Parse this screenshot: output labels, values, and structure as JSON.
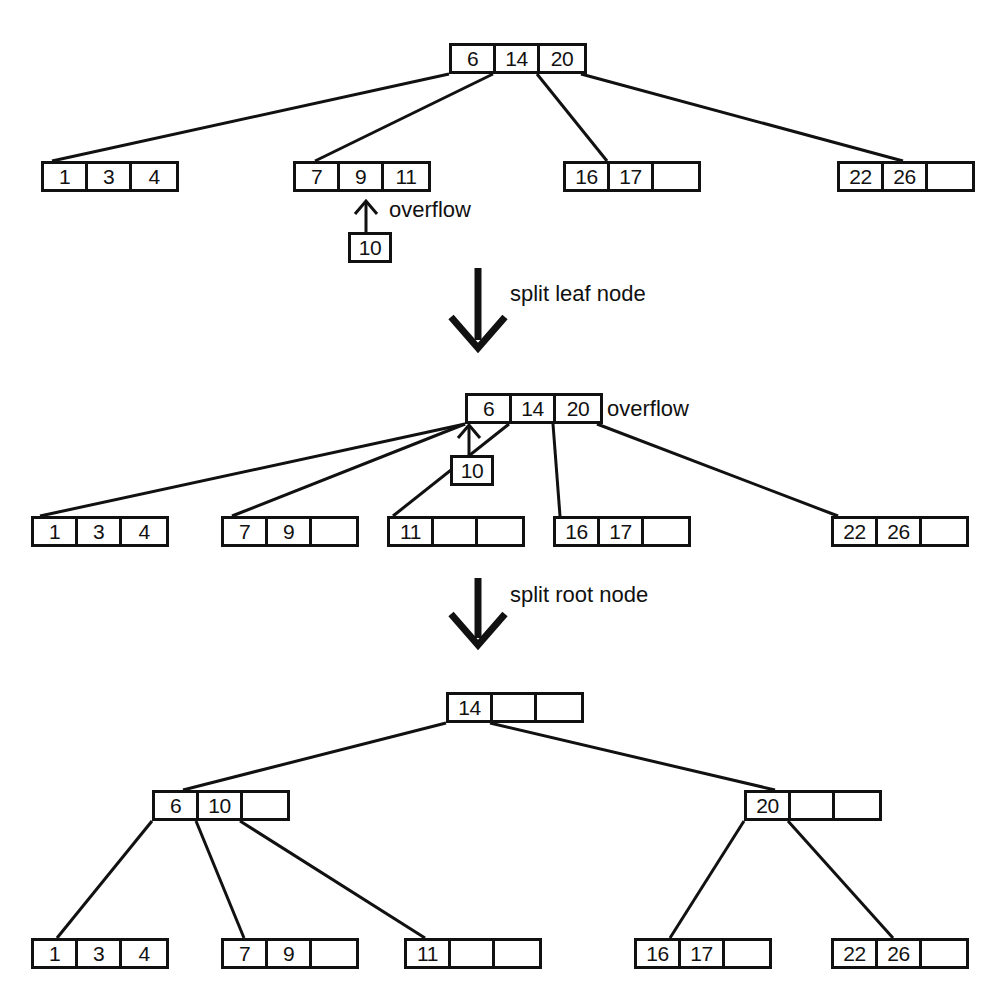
{
  "figure": {
    "type": "diagram"
  },
  "stages": [
    {
      "id": "stage-1-before-split",
      "root": {
        "id": "t1-root",
        "cells": [
          "6",
          "14",
          "20"
        ]
      },
      "leaves": [
        {
          "id": "t1-leaf-1",
          "cells": [
            "1",
            "3",
            "4"
          ]
        },
        {
          "id": "t1-leaf-2",
          "cells": [
            "7",
            "9",
            "11"
          ]
        },
        {
          "id": "t1-leaf-3",
          "cells": [
            "16",
            "17",
            ""
          ]
        },
        {
          "id": "t1-leaf-4",
          "cells": [
            "22",
            "26",
            ""
          ]
        }
      ],
      "overflow": {
        "id": "t1-overflow-box",
        "cells": [
          "10"
        ],
        "label": "overflow"
      }
    },
    {
      "id": "stage-2-after-leaf-split",
      "root": {
        "id": "t2-root",
        "cells": [
          "6",
          "14",
          "20"
        ]
      },
      "root_overflow_label": "overflow",
      "leaves": [
        {
          "id": "t2-leaf-1",
          "cells": [
            "1",
            "3",
            "4"
          ]
        },
        {
          "id": "t2-leaf-2",
          "cells": [
            "7",
            "9",
            ""
          ]
        },
        {
          "id": "t2-leaf-3",
          "cells": [
            "11",
            "",
            ""
          ]
        },
        {
          "id": "t2-leaf-4",
          "cells": [
            "16",
            "17",
            ""
          ]
        },
        {
          "id": "t2-leaf-5",
          "cells": [
            "22",
            "26",
            ""
          ]
        }
      ],
      "overflow": {
        "id": "t2-overflow-box",
        "cells": [
          "10"
        ]
      }
    },
    {
      "id": "stage-3-after-root-split",
      "root": {
        "id": "t3-root",
        "cells": [
          "14",
          "",
          ""
        ]
      },
      "internals": [
        {
          "id": "t3-internal-left",
          "cells": [
            "6",
            "10",
            ""
          ]
        },
        {
          "id": "t3-internal-right",
          "cells": [
            "20",
            "",
            ""
          ]
        }
      ],
      "leaves": [
        {
          "id": "t3-leaf-1",
          "cells": [
            "1",
            "3",
            "4"
          ]
        },
        {
          "id": "t3-leaf-2",
          "cells": [
            "7",
            "9",
            ""
          ]
        },
        {
          "id": "t3-leaf-3",
          "cells": [
            "11",
            "",
            ""
          ]
        },
        {
          "id": "t3-leaf-4",
          "cells": [
            "16",
            "17",
            ""
          ]
        },
        {
          "id": "t3-leaf-5",
          "cells": [
            "22",
            "26",
            ""
          ]
        }
      ]
    }
  ],
  "transitions": [
    {
      "id": "transition-1",
      "label": "split leaf node"
    },
    {
      "id": "transition-2",
      "label": "split root node"
    }
  ],
  "colors": {
    "ink": "#111111",
    "background": "#ffffff"
  }
}
